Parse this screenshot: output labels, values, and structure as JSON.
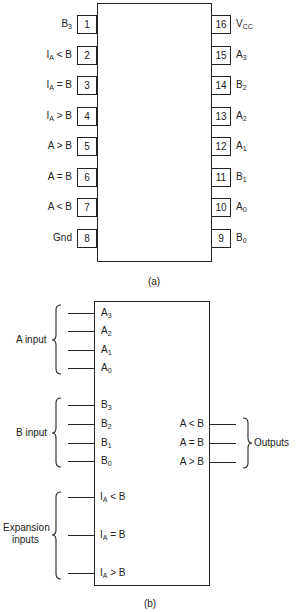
{
  "figure_a": {
    "caption": "(a)",
    "left_pins": [
      {
        "number": "1",
        "name": "B",
        "sub": "3",
        "suffix": ""
      },
      {
        "number": "2",
        "name": "I",
        "sub": "A",
        "suffix": " < B"
      },
      {
        "number": "3",
        "name": "I",
        "sub": "A",
        "suffix": " = B"
      },
      {
        "number": "4",
        "name": "I",
        "sub": "A",
        "suffix": " > B"
      },
      {
        "number": "5",
        "name": "A > B",
        "sub": "",
        "suffix": ""
      },
      {
        "number": "6",
        "name": "A = B",
        "sub": "",
        "suffix": ""
      },
      {
        "number": "7",
        "name": "A < B",
        "sub": "",
        "suffix": ""
      },
      {
        "number": "8",
        "name": "Gnd",
        "sub": "",
        "suffix": ""
      }
    ],
    "right_pins": [
      {
        "number": "16",
        "name": "V",
        "sub": "CC"
      },
      {
        "number": "15",
        "name": "A",
        "sub": "3"
      },
      {
        "number": "14",
        "name": "B",
        "sub": "2"
      },
      {
        "number": "13",
        "name": "A",
        "sub": "2"
      },
      {
        "number": "12",
        "name": "A",
        "sub": "1"
      },
      {
        "number": "11",
        "name": "B",
        "sub": "1"
      },
      {
        "number": "10",
        "name": "A",
        "sub": "0"
      },
      {
        "number": "9",
        "name": "B",
        "sub": "0"
      }
    ]
  },
  "figure_b": {
    "caption": "(b)",
    "groups": {
      "a_input": "A input",
      "b_input": "B input",
      "expansion_line1": "Expansion",
      "expansion_line2": "inputs",
      "outputs": "Outputs"
    },
    "a_inputs": [
      {
        "name": "A",
        "sub": "3"
      },
      {
        "name": "A",
        "sub": "2"
      },
      {
        "name": "A",
        "sub": "1"
      },
      {
        "name": "A",
        "sub": "0"
      }
    ],
    "b_inputs": [
      {
        "name": "B",
        "sub": "3"
      },
      {
        "name": "B",
        "sub": "2"
      },
      {
        "name": "B",
        "sub": "1"
      },
      {
        "name": "B",
        "sub": "0"
      }
    ],
    "expansion_inputs": [
      {
        "name": "I",
        "sub": "A",
        "suffix": " < B"
      },
      {
        "name": "I",
        "sub": "A",
        "suffix": " = B"
      },
      {
        "name": "I",
        "sub": "A",
        "suffix": " > B"
      }
    ],
    "outputs": [
      {
        "name": "A < B"
      },
      {
        "name": "A = B"
      },
      {
        "name": "A > B"
      }
    ]
  }
}
